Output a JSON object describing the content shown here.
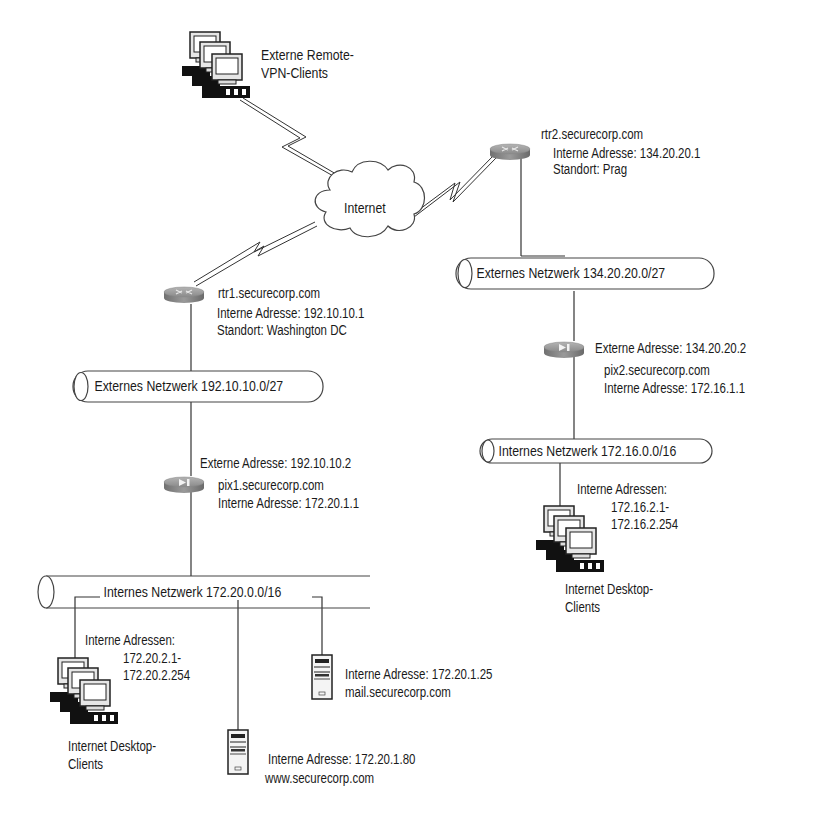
{
  "diagram": {
    "type": "network-topology",
    "nodes": {
      "vpn_clients": {
        "icon": "workstation-cluster-icon",
        "label_line1": "Externe Remote-",
        "label_line2": "VPN-Clients"
      },
      "internet": {
        "icon": "cloud-icon",
        "label": "Internet"
      },
      "rtr2": {
        "icon": "router-icon",
        "hostname": "rtr2.securecorp.com",
        "address": "Interne Adresse: 134.20.20.1",
        "location": "Standort: Prag"
      },
      "rtr1": {
        "icon": "router-icon",
        "hostname": "rtr1.securecorp.com",
        "address": "Interne Adresse: 192.10.10.1",
        "location": "Standort: Washington DC"
      },
      "ext_net_2": {
        "icon": "network-segment-icon",
        "label": "Externes Netzwerk 134.20.20.0/27"
      },
      "ext_net_1": {
        "icon": "network-segment-icon",
        "label": "Externes Netzwerk 192.10.10.0/27"
      },
      "pix2": {
        "icon": "firewall-icon",
        "external": "Externe Adresse: 134.20.20.2",
        "hostname": "pix2.securecorp.com",
        "internal": "Interne Adresse: 172.16.1.1"
      },
      "pix1": {
        "icon": "firewall-icon",
        "external": "Externe Adresse: 192.10.10.2",
        "hostname": "pix1.securecorp.com",
        "internal": "Interne Adresse: 172.20.1.1"
      },
      "int_net_2": {
        "icon": "network-segment-icon",
        "label": "Internes Netzwerk 172.16.0.0/16"
      },
      "int_net_1": {
        "icon": "network-segment-icon",
        "label": "Internes Netzwerk 172.20.0.0/16"
      },
      "desktops_2": {
        "icon": "workstation-cluster-icon",
        "addr_title": "Interne Adressen:",
        "addr_from": "172.16.2.1-",
        "addr_to": "172.16.2.254",
        "label_line1": "Internet Desktop-",
        "label_line2": "Clients"
      },
      "desktops_1": {
        "icon": "workstation-cluster-icon",
        "addr_title": "Interne Adressen:",
        "addr_from": "172.20.2.1-",
        "addr_to": "172.20.2.254",
        "label_line1": "Internet Desktop-",
        "label_line2": "Clients"
      },
      "mail_server": {
        "icon": "server-tower-icon",
        "address": "Interne Adresse: 172.20.1.25",
        "hostname": "mail.securecorp.com"
      },
      "web_server": {
        "icon": "server-tower-icon",
        "address": "Interne Adresse: 172.20.1.80",
        "hostname": "www.securecorp.com"
      }
    },
    "links": [
      {
        "from": "vpn_clients",
        "to": "internet",
        "kind": "wan-lightning"
      },
      {
        "from": "internet",
        "to": "rtr2",
        "kind": "wan-lightning"
      },
      {
        "from": "internet",
        "to": "rtr1",
        "kind": "wan-lightning"
      },
      {
        "from": "rtr2",
        "to": "ext_net_2",
        "kind": "wire"
      },
      {
        "from": "ext_net_2",
        "to": "pix2",
        "kind": "wire"
      },
      {
        "from": "pix2",
        "to": "int_net_2",
        "kind": "wire"
      },
      {
        "from": "int_net_2",
        "to": "desktops_2",
        "kind": "wire"
      },
      {
        "from": "rtr1",
        "to": "ext_net_1",
        "kind": "wire"
      },
      {
        "from": "ext_net_1",
        "to": "pix1",
        "kind": "wire"
      },
      {
        "from": "pix1",
        "to": "int_net_1",
        "kind": "wire"
      },
      {
        "from": "int_net_1",
        "to": "desktops_1",
        "kind": "wire"
      },
      {
        "from": "int_net_1",
        "to": "web_server",
        "kind": "wire"
      },
      {
        "from": "int_net_1",
        "to": "mail_server",
        "kind": "wire"
      }
    ],
    "colors": {
      "line": "#333333",
      "device_body": "#8c8c8c",
      "device_top": "#a8a8a8",
      "text": "#1a1a1a"
    }
  }
}
